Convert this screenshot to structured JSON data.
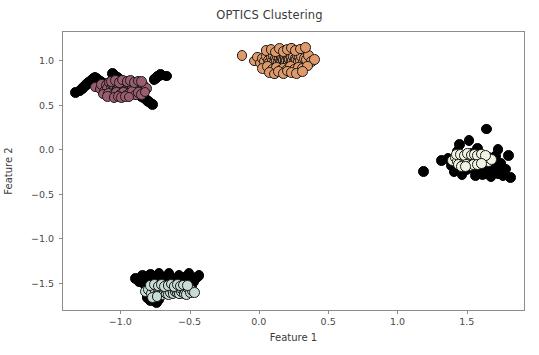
{
  "chart_data": {
    "type": "scatter",
    "title": "OPTICS Clustering",
    "xlabel": "Feature 1",
    "ylabel": "Feature 2",
    "xlim": [
      -1.42,
      1.92
    ],
    "ylim": [
      -1.82,
      1.33
    ],
    "xticks": [
      -1.0,
      -0.5,
      0.0,
      0.5,
      1.0,
      1.5
    ],
    "xticklabels": [
      "-1.0",
      "-0.5",
      "0.0",
      "0.5",
      "1.0",
      "1.5"
    ],
    "yticks": [
      1.0,
      0.5,
      0.0,
      -0.5,
      -1.0,
      -1.5
    ],
    "yticklabels": [
      "1.0",
      "0.5",
      "0.0",
      "-0.5",
      "-1.0",
      "-1.5"
    ],
    "grid": false,
    "legend": "none",
    "marker": "circle",
    "marker_size": 5.4,
    "marker_edge_color": "#1a1a1a",
    "marker_edge_width": 0.8,
    "series": [
      {
        "name": "Cluster 0",
        "color": "#9a5d6d",
        "x": [
          -1.186,
          -1.152,
          -1.141,
          -1.118,
          -1.107,
          -1.098,
          -1.086,
          -1.074,
          -1.069,
          -1.061,
          -1.055,
          -1.048,
          -1.041,
          -1.036,
          -1.029,
          -1.022,
          -1.017,
          -1.011,
          -1.004,
          -0.998,
          -0.993,
          -0.987,
          -0.981,
          -0.976,
          -0.971,
          -0.966,
          -0.961,
          -0.956,
          -0.951,
          -0.946,
          -0.941,
          -0.936,
          -0.931,
          -0.926,
          -0.921,
          -0.916,
          -0.911,
          -0.906,
          -0.901,
          -0.896,
          -0.891,
          -0.886,
          -0.881,
          -0.876,
          -0.871,
          -0.864,
          -0.858,
          -0.851,
          -0.844,
          -0.836,
          -0.828,
          -0.818,
          -1.128,
          -1.092,
          -1.064,
          -1.033,
          -1.008,
          -0.984,
          -0.962,
          -0.939,
          -0.918,
          -0.897,
          -0.874,
          -0.851,
          -0.829,
          -1.071,
          -1.04,
          -1.012,
          -0.988,
          -0.958,
          -0.932,
          -0.904,
          -0.879,
          -0.856,
          -1.101,
          -1.052,
          -1.021,
          -0.996,
          -0.969,
          -0.944
        ],
        "y": [
          0.712,
          0.688,
          0.742,
          0.661,
          0.724,
          0.695,
          0.758,
          0.671,
          0.707,
          0.736,
          0.684,
          0.719,
          0.752,
          0.668,
          0.701,
          0.733,
          0.689,
          0.714,
          0.745,
          0.676,
          0.709,
          0.728,
          0.692,
          0.721,
          0.748,
          0.673,
          0.705,
          0.731,
          0.686,
          0.716,
          0.741,
          0.679,
          0.711,
          0.726,
          0.697,
          0.718,
          0.739,
          0.682,
          0.703,
          0.729,
          0.691,
          0.713,
          0.735,
          0.677,
          0.708,
          0.722,
          0.694,
          0.717,
          0.744,
          0.685,
          0.706,
          0.698,
          0.633,
          0.642,
          0.618,
          0.651,
          0.626,
          0.645,
          0.612,
          0.638,
          0.658,
          0.621,
          0.649,
          0.631,
          0.655,
          0.774,
          0.781,
          0.766,
          0.789,
          0.771,
          0.784,
          0.762,
          0.778,
          0.769,
          0.602,
          0.596,
          0.608,
          0.591,
          0.604,
          0.599
        ]
      },
      {
        "name": "Cluster 1",
        "color": "#e09a6a",
        "x": [
          -0.129,
          -0.041,
          -0.016,
          0.004,
          0.021,
          0.036,
          0.049,
          0.061,
          0.072,
          0.082,
          0.091,
          0.099,
          0.107,
          0.114,
          0.121,
          0.128,
          0.134,
          0.141,
          0.147,
          0.153,
          0.159,
          0.164,
          0.17,
          0.176,
          0.181,
          0.187,
          0.192,
          0.198,
          0.203,
          0.209,
          0.214,
          0.22,
          0.226,
          0.231,
          0.237,
          0.243,
          0.249,
          0.256,
          0.262,
          0.269,
          0.276,
          0.284,
          0.292,
          0.301,
          0.311,
          0.322,
          0.335,
          0.351,
          0.372,
          0.392,
          0.019,
          0.057,
          0.089,
          0.118,
          0.146,
          0.172,
          0.198,
          0.224,
          0.251,
          0.279,
          0.309,
          0.341,
          0.044,
          0.081,
          0.113,
          0.143,
          0.171,
          0.199,
          0.228,
          0.258,
          0.291,
          0.327,
          0.067,
          0.104,
          0.137,
          0.168,
          0.199,
          0.231,
          0.266,
          0.305
        ],
        "y": [
          1.062,
          1.004,
          1.048,
          0.981,
          1.031,
          0.995,
          1.058,
          1.012,
          0.987,
          1.041,
          1.003,
          1.067,
          0.992,
          1.035,
          1.009,
          1.054,
          0.984,
          1.028,
          1.001,
          1.046,
          0.989,
          1.033,
          1.015,
          1.059,
          0.994,
          1.037,
          1.007,
          1.051,
          0.986,
          1.029,
          1.018,
          1.063,
          0.997,
          1.04,
          1.011,
          1.055,
          0.991,
          1.034,
          1.021,
          1.066,
          0.999,
          1.043,
          1.013,
          1.057,
          0.993,
          1.036,
          1.024,
          1.068,
          1.002,
          1.017,
          0.921,
          0.938,
          0.909,
          0.931,
          0.902,
          0.926,
          0.914,
          0.941,
          0.906,
          0.934,
          0.918,
          0.947,
          1.118,
          1.134,
          1.106,
          1.142,
          1.112,
          1.129,
          1.151,
          1.121,
          1.139,
          1.157,
          0.872,
          0.858,
          0.884,
          0.866,
          0.891,
          0.877,
          0.861,
          0.889
        ]
      },
      {
        "name": "Cluster 2",
        "color": "#f2f2e2",
        "x": [
          1.392,
          1.411,
          1.426,
          1.438,
          1.449,
          1.458,
          1.467,
          1.475,
          1.483,
          1.49,
          1.497,
          1.504,
          1.511,
          1.518,
          1.524,
          1.531,
          1.537,
          1.544,
          1.55,
          1.557,
          1.563,
          1.57,
          1.577,
          1.584,
          1.591,
          1.599,
          1.607,
          1.616,
          1.626,
          1.637,
          1.651,
          1.669,
          1.417,
          1.447,
          1.474,
          1.499,
          1.523,
          1.547,
          1.572,
          1.598,
          1.627,
          1.434,
          1.464,
          1.492,
          1.518,
          1.544,
          1.571,
          1.601,
          1.452,
          1.486
        ],
        "y": [
          -0.112,
          -0.082,
          -0.131,
          -0.068,
          -0.104,
          -0.142,
          -0.076,
          -0.118,
          -0.091,
          -0.136,
          -0.071,
          -0.108,
          -0.129,
          -0.084,
          -0.121,
          -0.096,
          -0.139,
          -0.074,
          -0.113,
          -0.088,
          -0.126,
          -0.101,
          -0.133,
          -0.079,
          -0.116,
          -0.094,
          -0.128,
          -0.086,
          -0.119,
          -0.098,
          -0.124,
          -0.107,
          -0.051,
          -0.044,
          -0.058,
          -0.039,
          -0.054,
          -0.047,
          -0.061,
          -0.042,
          -0.056,
          -0.161,
          -0.168,
          -0.154,
          -0.172,
          -0.158,
          -0.165,
          -0.151,
          -0.187,
          -0.179
        ]
      },
      {
        "name": "Cluster 3",
        "color": "#c6dcd4",
        "x": [
          -0.824,
          -0.801,
          -0.784,
          -0.769,
          -0.756,
          -0.744,
          -0.733,
          -0.723,
          -0.714,
          -0.705,
          -0.696,
          -0.688,
          -0.68,
          -0.672,
          -0.664,
          -0.657,
          -0.649,
          -0.642,
          -0.634,
          -0.627,
          -0.619,
          -0.612,
          -0.604,
          -0.596,
          -0.589,
          -0.581,
          -0.573,
          -0.564,
          -0.556,
          -0.547,
          -0.537,
          -0.527,
          -0.516,
          -0.503,
          -0.489,
          -0.471,
          -0.793,
          -0.761,
          -0.734,
          -0.709,
          -0.686,
          -0.663,
          -0.641,
          -0.619,
          -0.596,
          -0.573,
          -0.548,
          -0.521,
          -0.776,
          -0.742
        ],
        "y": [
          -1.592,
          -1.566,
          -1.614,
          -1.549,
          -1.588,
          -1.628,
          -1.561,
          -1.601,
          -1.574,
          -1.619,
          -1.554,
          -1.594,
          -1.567,
          -1.609,
          -1.581,
          -1.623,
          -1.558,
          -1.598,
          -1.571,
          -1.612,
          -1.549,
          -1.589,
          -1.563,
          -1.606,
          -1.577,
          -1.618,
          -1.552,
          -1.592,
          -1.569,
          -1.611,
          -1.584,
          -1.621,
          -1.557,
          -1.597,
          -1.574,
          -1.602,
          -1.519,
          -1.509,
          -1.527,
          -1.514,
          -1.531,
          -1.521,
          -1.506,
          -1.534,
          -1.512,
          -1.528,
          -1.517,
          -1.524,
          -1.661,
          -1.648
        ]
      },
      {
        "name": "Noise",
        "color": "#000000",
        "x": [
          -1.331,
          -1.297,
          -1.282,
          -1.271,
          -1.259,
          -1.248,
          -1.236,
          -1.224,
          -1.212,
          -1.201,
          -1.189,
          -1.177,
          -1.164,
          -1.152,
          -1.139,
          -1.126,
          -1.114,
          -1.102,
          -1.089,
          -1.077,
          -1.064,
          -1.052,
          -1.039,
          -1.027,
          -1.014,
          -1.001,
          -0.989,
          -0.976,
          -0.964,
          -0.951,
          -0.939,
          -0.926,
          -0.914,
          -0.901,
          -0.889,
          -0.876,
          -0.864,
          -0.851,
          -0.839,
          -0.826,
          -0.814,
          -0.801,
          -0.789,
          -0.776,
          -0.764,
          -0.751,
          -0.739,
          -0.726,
          -0.714,
          -0.676,
          1.179,
          1.312,
          1.358,
          1.381,
          1.401,
          1.423,
          1.441,
          1.459,
          1.476,
          1.492,
          1.509,
          1.524,
          1.541,
          1.557,
          1.572,
          1.589,
          1.604,
          1.621,
          1.637,
          1.652,
          1.668,
          1.684,
          1.701,
          1.718,
          1.736,
          1.754,
          1.772,
          1.791,
          1.811,
          1.556,
          1.573,
          1.591,
          1.608,
          1.626,
          1.644,
          1.662,
          1.681,
          1.699,
          1.718,
          1.737,
          -0.896,
          -0.871,
          -0.849,
          -0.827,
          -0.806,
          -0.786,
          -0.766,
          -0.747,
          -0.728,
          -0.709,
          -0.691,
          -0.673,
          -0.655,
          -0.637,
          -0.619,
          -0.601,
          -0.583,
          -0.565,
          -0.547,
          -0.529,
          -0.511,
          -0.493,
          -0.475,
          -0.457,
          -0.439,
          -0.814,
          -0.791,
          -0.769,
          -0.748,
          -0.727
        ],
        "y": [
          0.652,
          0.668,
          0.698,
          0.712,
          0.729,
          0.744,
          0.761,
          0.775,
          0.791,
          0.806,
          0.821,
          0.806,
          0.791,
          0.777,
          0.762,
          0.748,
          0.733,
          0.719,
          0.704,
          0.689,
          0.862,
          0.847,
          0.831,
          0.816,
          0.801,
          0.786,
          0.771,
          0.756,
          0.741,
          0.726,
          0.711,
          0.696,
          0.681,
          0.666,
          0.651,
          0.636,
          0.621,
          0.606,
          0.591,
          0.576,
          0.561,
          0.546,
          0.531,
          0.516,
          0.796,
          0.811,
          0.826,
          0.841,
          0.856,
          0.836,
          -0.236,
          -0.112,
          -0.089,
          -0.176,
          -0.244,
          -0.018,
          0.061,
          -0.271,
          -0.149,
          -0.221,
          0.108,
          -0.039,
          -0.196,
          -0.281,
          0.021,
          -0.124,
          -0.254,
          -0.169,
          0.238,
          -0.086,
          -0.299,
          -0.204,
          -0.066,
          0.012,
          -0.144,
          -0.289,
          -0.211,
          -0.059,
          -0.311,
          -0.226,
          -0.181,
          -0.134,
          -0.276,
          -0.219,
          -0.164,
          -0.291,
          -0.241,
          -0.109,
          -0.266,
          -0.196,
          -1.441,
          -1.482,
          -1.409,
          -1.524,
          -1.461,
          -1.398,
          -1.506,
          -1.446,
          -1.389,
          -1.516,
          -1.471,
          -1.424,
          -1.391,
          -1.534,
          -1.486,
          -1.441,
          -1.404,
          -1.509,
          -1.466,
          -1.421,
          -1.384,
          -1.521,
          -1.479,
          -1.434,
          -1.411,
          -1.661,
          -1.694,
          -1.629,
          -1.711,
          -1.676
        ]
      }
    ]
  }
}
